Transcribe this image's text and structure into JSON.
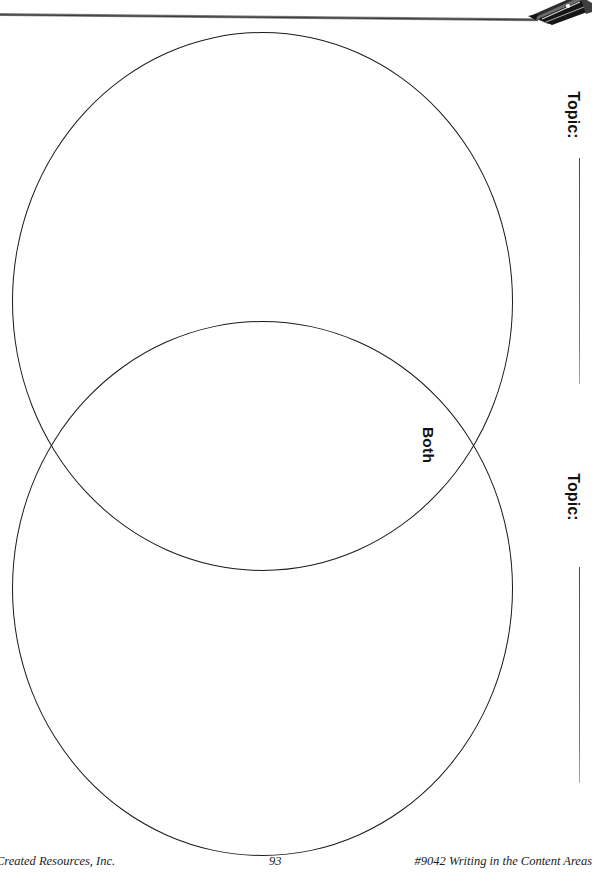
{
  "page": {
    "type": "venn-diagram-worksheet",
    "orientation": "rotated-landscape",
    "background_color": "#ffffff",
    "ink_color": "#1a1a1a"
  },
  "header": {
    "rule_present": true,
    "icon": "pen-nib-icon",
    "rule_color": "#5d5d5d"
  },
  "diagram": {
    "overlap_label": "Both",
    "circle_top": {
      "name": "venn-circle-top"
    },
    "circle_bottom": {
      "name": "venn-circle-bottom"
    }
  },
  "topics": [
    {
      "label": "Topic:",
      "value": "",
      "placeholder": ""
    },
    {
      "label": "Topic:",
      "value": "",
      "placeholder": ""
    }
  ],
  "footer": {
    "left": "Created Resources, Inc.",
    "page_number": "93",
    "right": "#9042 Writing in the Content Areas"
  }
}
